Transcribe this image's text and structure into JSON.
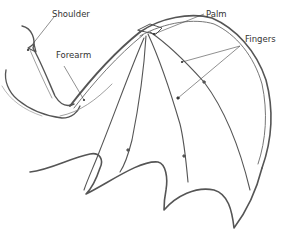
{
  "diagram": {
    "labels": {
      "shoulder": "Shoulder",
      "forearm": "Forearm",
      "palm": "Palm",
      "fingers": "Fingers"
    },
    "colors": {
      "stroke": "#555555",
      "stroke_light": "#8a8a8a",
      "text": "#333333",
      "background": "#ffffff"
    }
  }
}
